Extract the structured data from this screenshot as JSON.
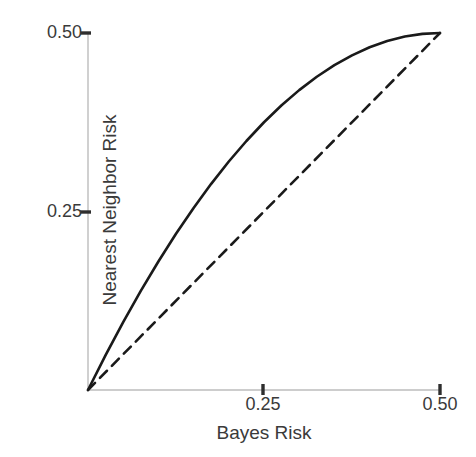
{
  "chart_data": {
    "type": "line",
    "title": "",
    "xlabel": "Bayes Risk",
    "ylabel": "Nearest Neighbor Risk",
    "xlim": [
      0,
      0.5
    ],
    "ylim": [
      0,
      0.5
    ],
    "xticks": [
      0.25,
      0.5
    ],
    "yticks": [
      0.25,
      0.5
    ],
    "xtick_labels": [
      "0.25",
      "0.50"
    ],
    "ytick_labels": [
      "0.25",
      "0.50"
    ],
    "grid": false,
    "legend": "none",
    "axis_color": "#b9b9b9",
    "tick_color": "#3a3a3a",
    "series": [
      {
        "name": "Nearest neighbor risk upper bound",
        "style": "solid",
        "color": "#1a1a1a",
        "width": 2.6,
        "formula": "y = 2p(1 - p)",
        "x": [
          0.0,
          0.025,
          0.05,
          0.075,
          0.1,
          0.125,
          0.15,
          0.175,
          0.2,
          0.225,
          0.25,
          0.275,
          0.3,
          0.325,
          0.35,
          0.375,
          0.4,
          0.425,
          0.45,
          0.475,
          0.5
        ],
        "values": [
          0.0,
          0.04875,
          0.095,
          0.13875,
          0.18,
          0.21875,
          0.255,
          0.28875,
          0.32,
          0.34875,
          0.375,
          0.39875,
          0.42,
          0.43875,
          0.455,
          0.46875,
          0.48,
          0.48875,
          0.495,
          0.49875,
          0.5
        ]
      },
      {
        "name": "Bayes risk reference line",
        "style": "dashed",
        "color": "#1a1a1a",
        "width": 2.6,
        "formula": "y = p",
        "x": [
          0.0,
          0.5
        ],
        "values": [
          0.0,
          0.5
        ]
      }
    ]
  },
  "axes": {
    "x_title": "Bayes Risk",
    "y_title": "Nearest Neighbor Risk",
    "x_tick_025": "0.25",
    "x_tick_050": "0.50",
    "y_tick_025": "0.25",
    "y_tick_050": "0.50"
  }
}
